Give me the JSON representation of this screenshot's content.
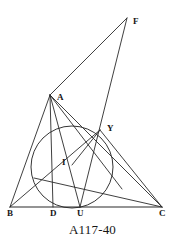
{
  "figure": {
    "caption": "A117-40",
    "ink_color": "#2a2a2a",
    "label_color": "#161616",
    "background_color": "#ffffff",
    "width": 185,
    "height": 245
  },
  "points": [
    {
      "id": "B",
      "label": "B",
      "x": 10,
      "y": 207,
      "label_x": 7,
      "label_y": 209,
      "role": "triangle-vertex"
    },
    {
      "id": "D",
      "label": "D",
      "x": 53,
      "y": 207,
      "label_x": 50,
      "label_y": 209,
      "role": "altitude-foot"
    },
    {
      "id": "U",
      "label": "U",
      "x": 80,
      "y": 207,
      "label_x": 77,
      "label_y": 209,
      "role": "incircle-touch-point"
    },
    {
      "id": "C",
      "label": "C",
      "x": 162,
      "y": 207,
      "label_x": 159,
      "label_y": 209,
      "role": "triangle-vertex"
    },
    {
      "id": "A",
      "label": "A",
      "x": 50,
      "y": 95,
      "label_x": 57,
      "label_y": 93,
      "role": "triangle-vertex"
    },
    {
      "id": "F",
      "label": "F",
      "x": 127,
      "y": 18,
      "label_x": 133,
      "label_y": 17,
      "role": "apex-point"
    },
    {
      "id": "Y",
      "label": "Y",
      "x": 100,
      "y": 130,
      "label_x": 107,
      "label_y": 124,
      "role": "circle-intersection"
    },
    {
      "id": "I",
      "label": "I",
      "x": 72,
      "y": 165,
      "label_x": 62,
      "label_y": 158,
      "role": "incenter"
    }
  ],
  "circle": {
    "name": "incircle",
    "cx": 72,
    "cy": 167,
    "r": 41
  },
  "segments": [
    {
      "name": "segment-BC",
      "from": "B",
      "to": "C",
      "kind": "baseline"
    },
    {
      "name": "segment-BA",
      "from": "B",
      "to": "A",
      "kind": "side"
    },
    {
      "name": "segment-AC",
      "from": "A",
      "to": "C",
      "kind": "side"
    },
    {
      "name": "segment-AD",
      "from": "A",
      "to": "D",
      "kind": "altitude"
    },
    {
      "name": "segment-AU",
      "from": "A",
      "to": "U",
      "kind": "cevian"
    },
    {
      "name": "segment-AI-extended",
      "from": "A",
      "to": "I",
      "kind": "angle-bisector"
    },
    {
      "name": "segment-BY",
      "from": "B",
      "to": "Y",
      "kind": "cevian"
    },
    {
      "name": "segment-IC",
      "from": "I",
      "to": "C",
      "kind": "cevian"
    },
    {
      "name": "segment-AF",
      "from": "A",
      "to": "F",
      "kind": "exterior"
    },
    {
      "name": "segment-FU",
      "from": "F",
      "to": "U",
      "kind": "exterior"
    },
    {
      "name": "segment-YC",
      "from": "Y",
      "to": "C",
      "kind": "chord-extension"
    }
  ]
}
